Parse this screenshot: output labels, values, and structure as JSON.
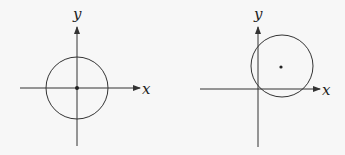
{
  "diagrams": [
    {
      "name": "circle-centered-at-origin",
      "x_label": "x",
      "y_label": "y",
      "center": [
        77,
        88
      ],
      "radius": 31
    },
    {
      "name": "circle-offset-through-origin",
      "x_label": "x",
      "y_label": "y",
      "center": [
        281,
        67
      ],
      "radius": 31
    }
  ],
  "colors": {
    "stroke": "#333333",
    "background": "#f7f7f7"
  }
}
